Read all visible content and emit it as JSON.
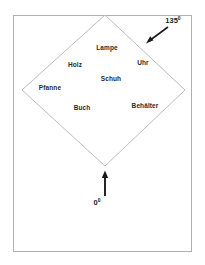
{
  "figure": {
    "frame": {
      "border_color": "#b0b0b0",
      "fill_color": "#ffffff"
    },
    "diamond": {
      "stroke_color": "#b8b8b8",
      "shape_name": "rotated-square-diamond"
    },
    "arrows": {
      "color": "#1a1a1a"
    },
    "region_labels": [
      {
        "text": "Lampe",
        "x": 107,
        "y": 48
      },
      {
        "text": "Uhr",
        "x": 143,
        "y": 63
      },
      {
        "text": "Holz",
        "x": 75,
        "y": 65
      },
      {
        "text": "Schuh",
        "x": 111,
        "y": 79
      },
      {
        "text": "Pfanne",
        "x": 50,
        "y": 88
      },
      {
        "text": "Buch",
        "x": 82,
        "y": 108
      },
      {
        "text": "Behälter",
        "x": 145,
        "y": 106
      }
    ],
    "angle_annotations": [
      {
        "value": "135",
        "degree": "0",
        "x": 173,
        "y": 21,
        "name": "angle-135-label"
      },
      {
        "value": "0",
        "degree": "0",
        "x": 97,
        "y": 203,
        "name": "angle-0-label"
      }
    ]
  }
}
